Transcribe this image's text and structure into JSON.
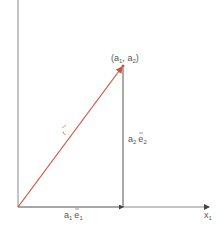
{
  "diagram": {
    "title": "",
    "point_label": "(a",
    "point": {
      "base": "a",
      "sub1": "1",
      "sep": ", ",
      "sub2": "2"
    },
    "vector_label": "r",
    "component_x": {
      "coef": "a",
      "coef_sub": "1",
      "unit": "e",
      "unit_sub": "1"
    },
    "component_y": {
      "coef": "a",
      "coef_sub": "2",
      "unit": "e",
      "unit_sub": "2"
    },
    "x_axis_label": {
      "base": "x",
      "sub": "1"
    },
    "colors": {
      "axis": "#8a8a8a",
      "vector": "#c8553d",
      "component": "#555555",
      "text": "#555555"
    }
  }
}
